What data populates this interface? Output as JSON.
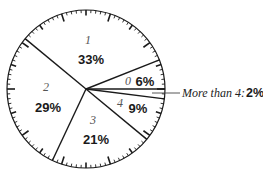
{
  "chart_data": {
    "type": "pie",
    "title": "",
    "style": "gauge-rim with 1% tick marks, boundaries drawn as lines",
    "start_angle_deg": 0,
    "direction": "counterclockwise",
    "slices": [
      {
        "category": "0",
        "value": 6,
        "label": "6%"
      },
      {
        "category": "1",
        "value": 33,
        "label": "33%"
      },
      {
        "category": "2",
        "value": 29,
        "label": "29%"
      },
      {
        "category": "3",
        "value": 21,
        "label": "21%"
      },
      {
        "category": "4",
        "value": 9,
        "label": "9%"
      },
      {
        "category": "More than 4",
        "value": 2,
        "label": "2%",
        "callout": true
      }
    ],
    "categories": [
      "0",
      "1",
      "2",
      "3",
      "4",
      "More than 4"
    ],
    "values": [
      6,
      33,
      29,
      21,
      9,
      2
    ],
    "legend": "none (labels placed inside slices; 'More than 4' via callout line)"
  },
  "geometry": {
    "cx": 86,
    "cy": 89,
    "r": 79
  },
  "labels": {
    "slice_0_cat": "0",
    "slice_0_pct": "6%",
    "slice_1_cat": "1",
    "slice_1_pct": "33%",
    "slice_2_cat": "2",
    "slice_2_pct": "29%",
    "slice_3_cat": "3",
    "slice_3_pct": "21%",
    "slice_4_cat": "4",
    "slice_4_pct": "9%",
    "callout_text": "More than 4:",
    "callout_pct": "2%"
  },
  "colors": {
    "line": "#1a1a1a",
    "background": "#ffffff",
    "category_label": "#555555"
  }
}
